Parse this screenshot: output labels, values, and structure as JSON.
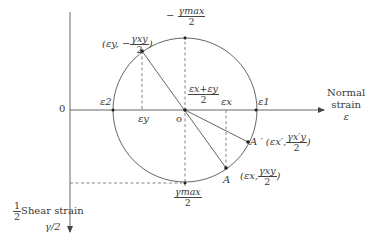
{
  "diagram": {
    "axes": {
      "horizontal": {
        "label_line1": "Normal",
        "label_line2": "strain",
        "symbol": "ε"
      },
      "vertical": {
        "prefix_num": "1",
        "prefix_den": "2",
        "label": "Shear strain",
        "symbol": "γ/2"
      },
      "origin_label": "0"
    },
    "circle": {
      "center_label": "o",
      "center": [
        185,
        110
      ],
      "radius": 72
    },
    "labels": {
      "gamma_max_top_num": "γmax",
      "gamma_max_top_sign": "−",
      "gamma_max_top_den": "2",
      "gamma_max_bottom_num": "γmax",
      "gamma_max_bottom_den": "2",
      "center_formula_num": "εx+εy",
      "center_formula_den": "2",
      "eps2": "ε2",
      "eps1": "ε1",
      "epsx": "εx",
      "epsy": "εy",
      "point_y": {
        "open": "(εy, −",
        "num": "γxy",
        "den": "2",
        "close": ")"
      },
      "point_a": {
        "name": "A",
        "open": "(εx,",
        "num": "γxy",
        "den": "2",
        "close": ")"
      },
      "point_a_prime": {
        "name": "A ′",
        "open": "(εx′,",
        "num": "γx′y",
        "den": "2",
        "close": ")"
      }
    },
    "colors": {
      "line": "#555555",
      "dash": "#666666",
      "point": "#222222"
    }
  }
}
